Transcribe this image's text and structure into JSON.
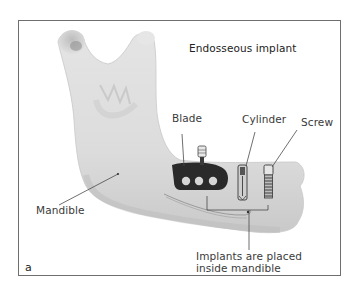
{
  "figure": {
    "title": "Endosseous implant",
    "panel_letter": "a",
    "labels": {
      "blade": "Blade",
      "cylinder": "Cylinder",
      "screw": "Screw",
      "mandible": "Mandible",
      "implants_line1": "Implants are placed",
      "implants_line2": "inside mandible"
    },
    "colors": {
      "bone": "#dedede",
      "bone_shadow": "#c4c4c4",
      "implant": "#2a2a2a",
      "frame": "#6f6f6f",
      "text": "#3a3a3a"
    }
  }
}
